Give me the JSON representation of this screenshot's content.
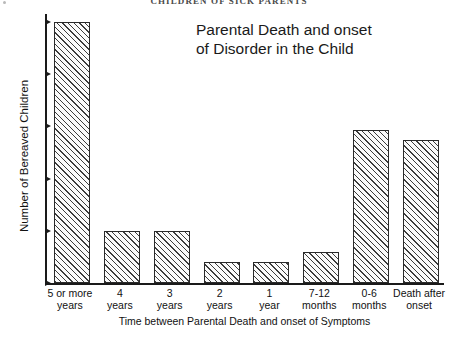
{
  "page": {
    "running_head": "CHILDREN  OF  SICK  PARENTS"
  },
  "chart_data": {
    "type": "bar",
    "title": "Parental Death and onset of Disorder in the Child",
    "title_line1": "Parental Death and onset",
    "title_line2": "of Disorder in the Child",
    "xlabel": "Time between Parental Death and onset of Symptoms",
    "ylabel": "Number of Bereaved Children",
    "ylim": [
      0,
      25
    ],
    "yticks": [
      0,
      5,
      10,
      15,
      20,
      25
    ],
    "ytick_labels": [
      "0",
      "5",
      "10",
      "15",
      "20",
      "25"
    ],
    "grid": false,
    "legend": null,
    "categories": [
      "5 or more years",
      "4 years",
      "3 years",
      "2 years",
      "1 year",
      "7-12 months",
      "0-6 months",
      "Death after onset"
    ],
    "category_lines": [
      [
        "5 or more",
        "years"
      ],
      [
        "4",
        "years"
      ],
      [
        "3",
        "years"
      ],
      [
        "2",
        "years"
      ],
      [
        "1",
        "year"
      ],
      [
        "7-12",
        "months"
      ],
      [
        "0-6",
        "months"
      ],
      [
        "Death after",
        "onset"
      ]
    ],
    "values": [
      25,
      5,
      5,
      2,
      2,
      3,
      14.7,
      13.7
    ],
    "bar_style": {
      "fill": "diagonal-hatch",
      "hatch_angle_deg": 45,
      "edge_color": "#2a2a2a",
      "face_color": "#fbfbfb"
    }
  }
}
